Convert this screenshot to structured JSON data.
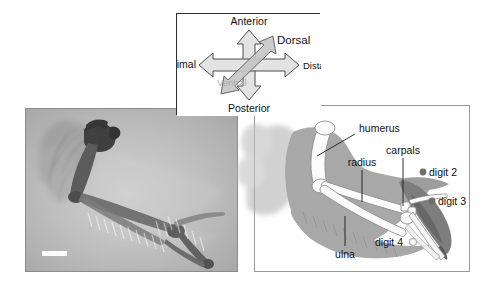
{
  "figure": {
    "background_color": "#ffffff"
  },
  "compass": {
    "name": "orientation-compass",
    "border_color": "#2e2e2e",
    "arrow_fill": "#e0e0e0",
    "arrow_stroke": "#4d4d4d",
    "diagonal_fill": "#c9c9c9",
    "labels": {
      "anterior": "Anterior",
      "posterior": "Posterior",
      "proximal": "Proximal",
      "distal": "Distal",
      "dorsal": "Dorsal",
      "ventral": "Ventral"
    },
    "label_colors": {
      "anterior": "#1a1a1a",
      "posterior": "#1a1a1a",
      "proximal": "#1a1a1a",
      "distal": "#1a1a1a",
      "dorsal": "#1a1a1a",
      "ventral": "#aaaaaa"
    }
  },
  "xray": {
    "name": "bat-wing-radiograph",
    "background_color": "#b7b7b7",
    "bone_color": "#6b6b6b",
    "scale_bar": {
      "label": "",
      "color": "#ffffff"
    }
  },
  "diagram": {
    "name": "bat-wing-diagram",
    "membrane_color": "#a8a8a8",
    "bone_color": "#fbfbfb",
    "bone_outline": "#8a8a8a",
    "dark_digit_color": "#6e6e6e",
    "leader_color": "#1a1a1a",
    "labels": [
      {
        "id": "humerus",
        "text": "humerus"
      },
      {
        "id": "radius",
        "text": "radius"
      },
      {
        "id": "carpals",
        "text": "carpals"
      },
      {
        "id": "ulna",
        "text": "ulna"
      },
      {
        "id": "digit2",
        "text": "digit 2",
        "marker": "filled",
        "marker_color": "#6e6e6e"
      },
      {
        "id": "digit3",
        "text": "digit 3",
        "marker": "filled",
        "marker_color": "#6e6e6e"
      },
      {
        "id": "digit4",
        "text": "digit 4",
        "marker": "open",
        "marker_color": "#b8b8b8"
      }
    ]
  }
}
